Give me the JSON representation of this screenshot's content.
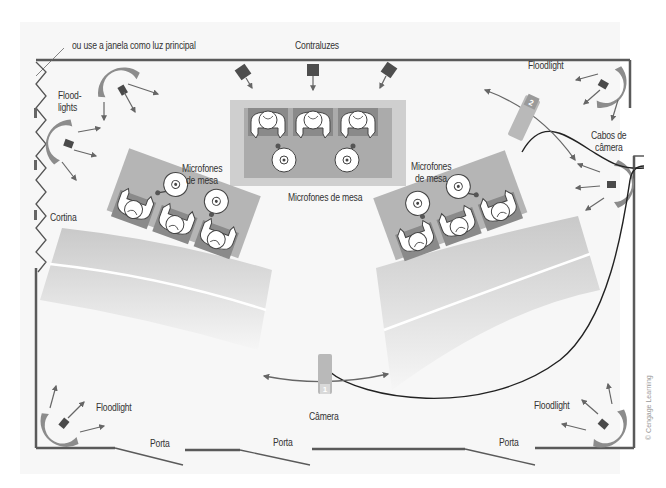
{
  "diagram": {
    "type": "studio-floor-plan",
    "labels": {
      "window_note": "ou use a janela como luz principal",
      "backlights": "Contraluzes",
      "floodlights_left": "Flood-\nlights",
      "floodlights_left_line1": "Flood-",
      "floodlights_left_line2": "lights",
      "floodlight_top_right": "Floodlight",
      "camera_cables_line1": "Cabos de",
      "camera_cables_line2": "câmera",
      "table_mics_center": "Microfones de mesa",
      "table_mics_left_line1": "Microfones",
      "table_mics_left_line2": "de mesa",
      "table_mics_right_line1": "Microfones",
      "table_mics_right_line2": "de mesa",
      "curtain": "Cortina",
      "floodlight_bottom_left": "Floodlight",
      "floodlight_bottom_right": "Floodlight",
      "camera": "Câmera",
      "door_1": "Porta",
      "door_2": "Porta",
      "door_3": "Porta",
      "camera_1_number": "1",
      "camera_2_number": "2"
    },
    "credit": "© Cengage Learning",
    "colors": {
      "wall": "#5a5a5a",
      "light_body": "#5c5c5c",
      "umbrella": "#8c8c8c",
      "table_outer": "#c8c8c8",
      "table_inner": "#a9a9a9",
      "chair": "#8a8a8a",
      "camera": "#b5b5b5",
      "cable": "#222222",
      "arrow": "#666666",
      "seating": "#d4d4d4"
    }
  }
}
